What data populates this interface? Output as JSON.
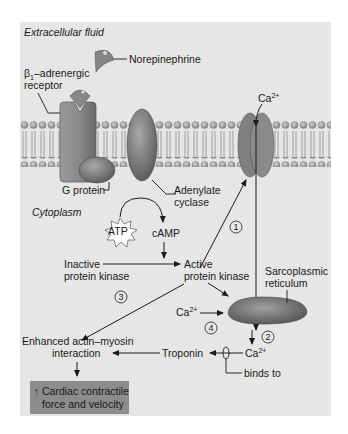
{
  "diagram": {
    "regions": {
      "extracellular": "Extracellular fluid",
      "cytoplasm": "Cytoplasm"
    },
    "labels": {
      "norepinephrine": "Norepinephrine",
      "receptor_line1": "β",
      "receptor_sub": "1",
      "receptor_line1_rest": "–adrenergic",
      "receptor_line2": "receptor",
      "g_protein": "G protein",
      "adenylate_line1": "Adenylate",
      "adenylate_line2": "cyclase",
      "atp": "ATP",
      "camp": "cAMP",
      "ca_top": "Ca",
      "ca_sup": "2+",
      "inactive_line1": "Inactive",
      "inactive_line2": "protein kinase",
      "active_line1": "Active",
      "active_line2": "protein kinase",
      "sr_line1": "Sarcoplasmic",
      "sr_line2": "reticulum",
      "ca_left": "Ca",
      "ca_bottom": "Ca",
      "troponin": "Troponin",
      "binds_to": "binds to",
      "enhanced_line1": "Enhanced actin–myosin",
      "enhanced_line2": "interaction",
      "result_line1": "Cardiac contractile",
      "result_line2": "force and velocity",
      "result_arrow": "↑"
    },
    "steps": [
      "1",
      "2",
      "3",
      "4"
    ],
    "colors": {
      "panel_bg": "#e6e6e6",
      "membrane_head": "#9a9a9a",
      "protein": "#7f7f7f",
      "protein_dark": "#5e5e5e",
      "result_box": "#8c8c8c",
      "text": "#1a1a1a"
    }
  }
}
